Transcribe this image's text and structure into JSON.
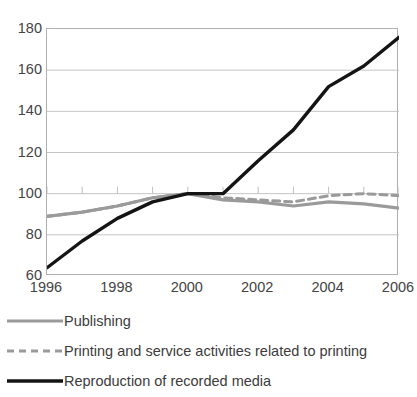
{
  "chart_data": {
    "type": "line",
    "title": "",
    "xlabel": "",
    "ylabel": "",
    "xlim": [
      1996,
      2006
    ],
    "ylim": [
      60,
      180
    ],
    "y_ticks": [
      60,
      80,
      100,
      120,
      140,
      160,
      180
    ],
    "x_ticks": [
      1996,
      1997,
      1998,
      1999,
      2000,
      2001,
      2002,
      2003,
      2004,
      2005,
      2006
    ],
    "x_tick_labels": [
      "1996",
      "",
      "1998",
      "",
      "2000",
      "",
      "2002",
      "",
      "2004",
      "",
      "2006"
    ],
    "grid": true,
    "legend_position": "bottom-left",
    "x": [
      1996,
      1997,
      1998,
      1999,
      2000,
      2001,
      2002,
      2003,
      2004,
      2005,
      2006
    ],
    "series": [
      {
        "name": "Publishing",
        "color": "#9a9a9a",
        "style": "solid",
        "width": 3.2,
        "values": [
          89,
          91,
          94,
          98,
          100,
          97,
          96,
          94,
          96,
          95,
          93
        ]
      },
      {
        "name": "Printing and service activities related to printing",
        "color": "#9a9a9a",
        "style": "dashed",
        "width": 3.0,
        "values": [
          89,
          91,
          94,
          98,
          100,
          98,
          97,
          96,
          99,
          100,
          99
        ]
      },
      {
        "name": "Reproduction of recorded media",
        "color": "#141414",
        "style": "solid",
        "width": 3.4,
        "values": [
          64,
          77,
          88,
          96,
          100,
          100,
          116,
          131,
          152,
          162,
          176
        ]
      }
    ]
  },
  "legend": {
    "items": [
      {
        "label": "Publishing",
        "swatch": "solid-gray-line"
      },
      {
        "label": "Printing and service activities related to printing",
        "swatch": "dashed-gray-line"
      },
      {
        "label": "Reproduction of recorded media",
        "swatch": "solid-black-line"
      }
    ]
  }
}
